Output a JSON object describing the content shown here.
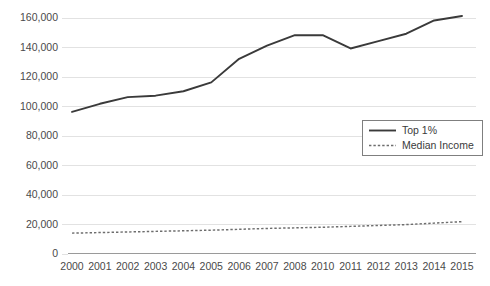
{
  "chart_data": {
    "type": "line",
    "title": "",
    "subtitle": "",
    "xlabel": "",
    "ylabel": "",
    "x": [
      "2000",
      "2001",
      "2002",
      "2003",
      "2004",
      "2005",
      "2006",
      "2007",
      "2008",
      "2010",
      "2011",
      "2012",
      "2013",
      "2014",
      "2015"
    ],
    "categories": [
      "2000",
      "2001",
      "2002",
      "2003",
      "2004",
      "2005",
      "2006",
      "2007",
      "2008",
      "2010",
      "2011",
      "2012",
      "2013",
      "2014",
      "2015"
    ],
    "series": [
      {
        "name": "Top 1%",
        "style": "solid",
        "color": "#3a3a3a",
        "values": [
          96000,
          101500,
          106000,
          107000,
          110000,
          116000,
          132000,
          141000,
          148000,
          148000,
          139000,
          144000,
          149000,
          158000,
          161000
        ]
      },
      {
        "name": "Median Income",
        "style": "dashed",
        "color": "#6d6d6d",
        "values": [
          13800,
          14200,
          14600,
          15000,
          15400,
          15800,
          16400,
          17000,
          17400,
          17800,
          18400,
          19000,
          19600,
          20600,
          21600
        ]
      }
    ],
    "ylim": [
      0,
      160000
    ],
    "yticks": [
      0,
      20000,
      40000,
      60000,
      80000,
      100000,
      120000,
      140000,
      160000
    ],
    "ytick_labels": [
      "0",
      "20,000",
      "40,000",
      "60,000",
      "80,000",
      "100,000",
      "120,000",
      "140,000",
      "160,000"
    ],
    "grid": true,
    "grid_axis": "y",
    "legend_position": "center-right",
    "legend_entries": [
      {
        "label": "Top 1%",
        "style": "solid"
      },
      {
        "label": "Median Income",
        "style": "dashed"
      }
    ],
    "colors": {
      "background": "#ffffff",
      "gridline": "#e2e2e2",
      "axis": "#9a9a9a",
      "text": "#4a4a4a",
      "top_one_percent": "#3a3a3a",
      "median_income": "#6d6d6d",
      "legend_border": "#7f7f7f"
    }
  }
}
